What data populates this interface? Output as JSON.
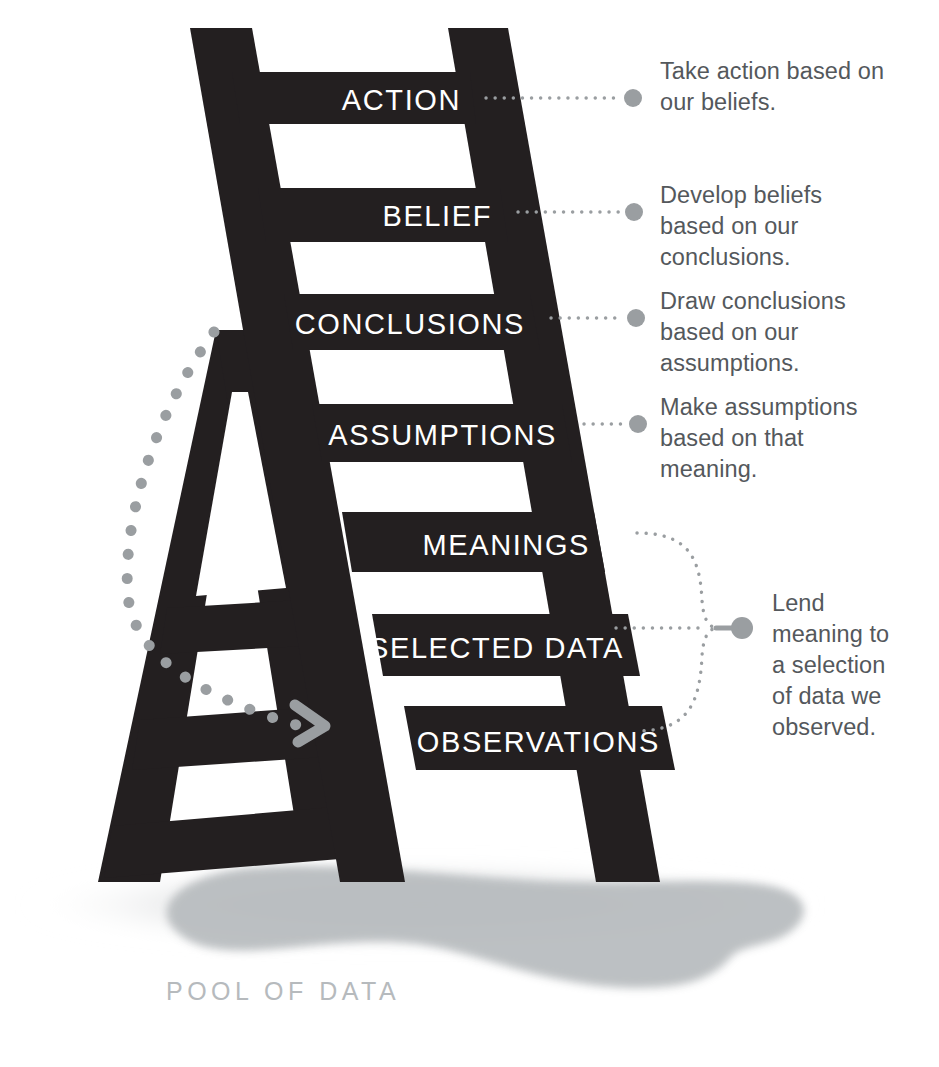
{
  "diagram": {
    "colors": {
      "ladder": "#231f20",
      "rung_label": "#ffffff",
      "annotation_text": "#54585c",
      "connector": "#9a9ea1",
      "pool_fill": "#b9bdc0",
      "pool_label": "#b6babd",
      "background": "#ffffff"
    },
    "ladder_steps": [
      {
        "label": "ACTION"
      },
      {
        "label": "BELIEF"
      },
      {
        "label": "CONCLUSIONS"
      },
      {
        "label": "ASSUMPTIONS"
      },
      {
        "label": "MEANINGS"
      },
      {
        "label": "SELECTED DATA"
      },
      {
        "label": "OBSERVATIONS"
      }
    ],
    "annotations": [
      {
        "text": "Take action based on\nour beliefs."
      },
      {
        "text": "Develop beliefs\nbased on our\nconclusions."
      },
      {
        "text": "Draw conclusions\nbased on our\nassumptions."
      },
      {
        "text": "Make assumptions\nbased on that\nmeaning."
      },
      {
        "text": "Lend\nmeaning to\na selection\nof data we\nobserved."
      }
    ],
    "pool_label": "POOL OF DATA"
  }
}
